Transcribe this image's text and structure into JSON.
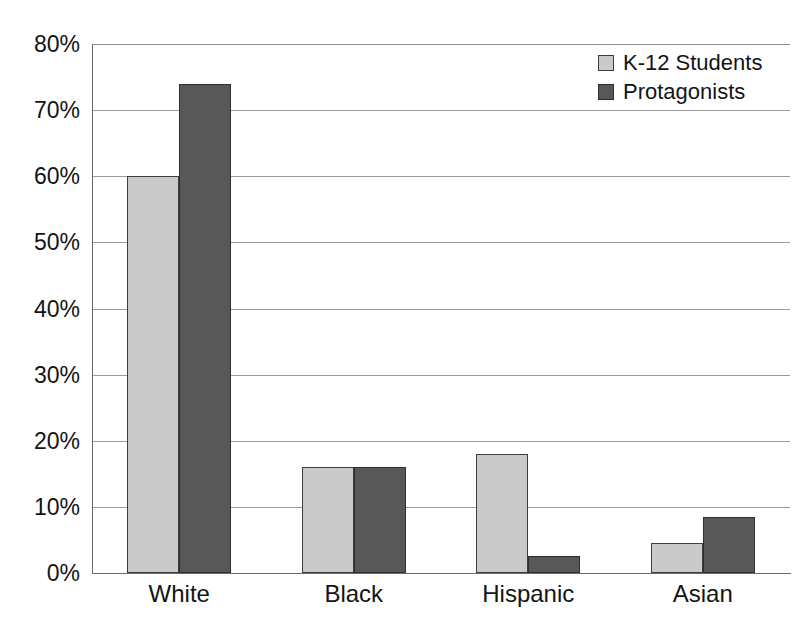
{
  "chart_data": {
    "type": "bar",
    "title": "",
    "subtitle": "",
    "xlabel": "",
    "ylabel": "",
    "categories": [
      "White",
      "Black",
      "Hispanic",
      "Asian"
    ],
    "series": [
      {
        "name": "K-12 Students",
        "color": "#cacaca",
        "values": [
          60,
          16,
          18,
          4.5
        ]
      },
      {
        "name": "Protagonists",
        "color": "#585858",
        "values": [
          74,
          16,
          2.5,
          8.5
        ]
      }
    ],
    "ylim": [
      0,
      80
    ],
    "ytick_values": [
      80,
      70,
      60,
      50,
      40,
      30,
      20,
      10,
      0
    ],
    "ytick_labels": [
      "80%",
      "70%",
      "60%",
      "50%",
      "40%",
      "30%",
      "20%",
      "10%",
      "0%"
    ],
    "grid": true,
    "grid_axis": "y",
    "legend_position": "top-right",
    "value_suffix": "%",
    "gridline_color": "#9a9a9a",
    "axis_color": "#6b6b6b",
    "text_color": "#141414",
    "background_color": "#ffffff"
  }
}
